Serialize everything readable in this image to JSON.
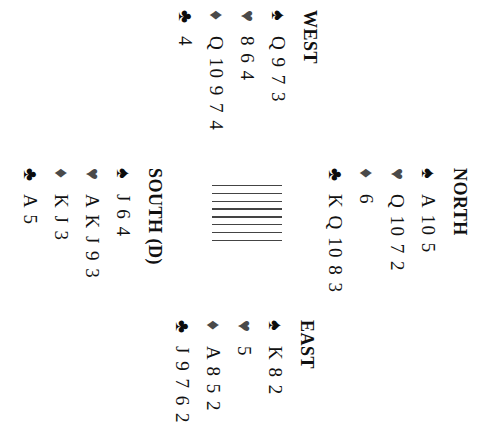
{
  "colors": {
    "black_suit": "#0c0c0c",
    "red_suit_printed": "#4a4a4a",
    "background": "#ffffff",
    "table_lines": "#444444"
  },
  "orientation": "rotated 90 degrees clockwise",
  "table_marker": {
    "line_count": 8
  },
  "hands": {
    "west": {
      "title": "WEST",
      "spades": "Q 9 7 3",
      "hearts": "8 6 4",
      "diamonds": "Q 10 9 7 4",
      "clubs": "4"
    },
    "north": {
      "title": "NORTH",
      "spades": "A 10 5",
      "hearts": "Q 10 7 2",
      "diamonds": "6",
      "clubs": "K Q 10 8 3"
    },
    "east": {
      "title": "EAST",
      "spades": "K 8 2",
      "hearts": "5",
      "diamonds": "A 8 5 2",
      "clubs": "J 9 7 6 2"
    },
    "south": {
      "title": "SOUTH (D)",
      "spades": "J 6 4",
      "hearts": "A K J 9 3",
      "diamonds": "K J 3",
      "clubs": "A 5"
    }
  },
  "suit_symbols": {
    "spade": "♠",
    "heart": "♥",
    "diamond": "♦",
    "club": "♣"
  }
}
